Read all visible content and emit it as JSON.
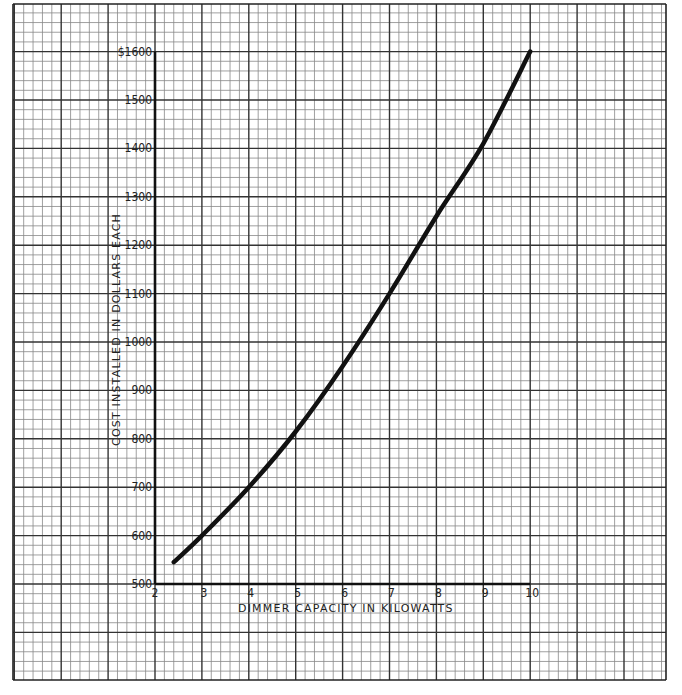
{
  "chart_data": {
    "type": "line",
    "title": "",
    "xlabel": "DIMMER CAPACITY IN KILOWATTS",
    "ylabel": "COST INSTALLED IN DOLLARS EACH",
    "xlim": [
      2,
      10
    ],
    "ylim": [
      500,
      1600
    ],
    "x_ticks": [
      "2",
      "3",
      "4",
      "5",
      "6",
      "7",
      "8",
      "9",
      "10"
    ],
    "y_ticks": [
      "500",
      "600",
      "700",
      "800",
      "900",
      "1000",
      "1100",
      "1200",
      "1300",
      "1400",
      "1500",
      "$1600"
    ],
    "grid": true,
    "legend": null,
    "series": [
      {
        "name": "Cost installed",
        "x": [
          2.4,
          3,
          4,
          5,
          6,
          7,
          8,
          9,
          10
        ],
        "y": [
          545,
          600,
          700,
          815,
          950,
          1100,
          1260,
          1410,
          1600
        ]
      }
    ]
  }
}
